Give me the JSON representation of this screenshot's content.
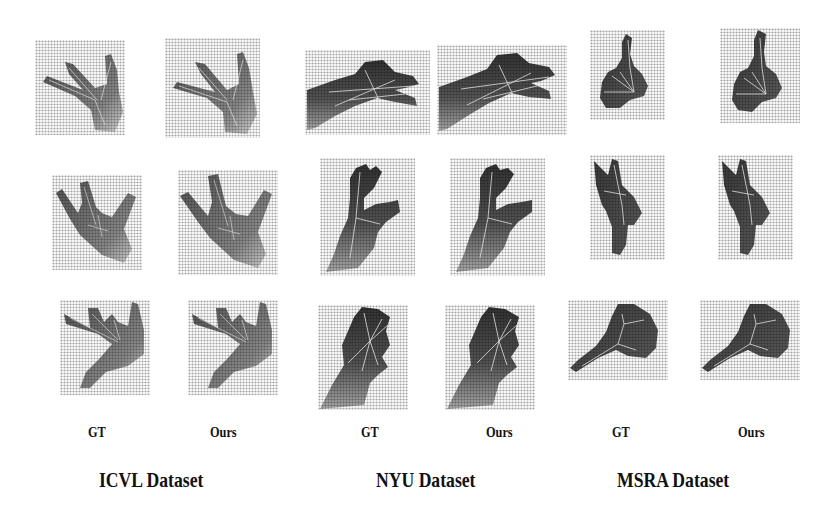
{
  "figure": {
    "column_labels": [
      "GT",
      "Ours",
      "GT",
      "Ours",
      "GT",
      "Ours"
    ],
    "datasets": [
      {
        "name": "ICVL Dataset",
        "columns": [
          "GT",
          "Ours"
        ]
      },
      {
        "name": "NYU Dataset",
        "columns": [
          "GT",
          "Ours"
        ]
      },
      {
        "name": "MSRA Dataset",
        "columns": [
          "GT",
          "Ours"
        ]
      }
    ],
    "rows": 3,
    "panels": [
      {
        "row": 1,
        "dataset": "ICVL",
        "gt": "hand-depth-gt",
        "ours": "hand-depth-pred"
      },
      {
        "row": 1,
        "dataset": "NYU",
        "gt": "hand-depth-gt",
        "ours": "hand-depth-pred"
      },
      {
        "row": 1,
        "dataset": "MSRA",
        "gt": "hand-depth-gt",
        "ours": "hand-depth-pred"
      },
      {
        "row": 2,
        "dataset": "ICVL",
        "gt": "hand-depth-gt",
        "ours": "hand-depth-pred"
      },
      {
        "row": 2,
        "dataset": "NYU",
        "gt": "hand-depth-gt",
        "ours": "hand-depth-pred"
      },
      {
        "row": 2,
        "dataset": "MSRA",
        "gt": "hand-depth-gt",
        "ours": "hand-depth-pred"
      },
      {
        "row": 3,
        "dataset": "ICVL",
        "gt": "hand-depth-gt",
        "ours": "hand-depth-pred"
      },
      {
        "row": 3,
        "dataset": "NYU",
        "gt": "hand-depth-gt",
        "ours": "hand-depth-pred"
      },
      {
        "row": 3,
        "dataset": "MSRA",
        "gt": "hand-depth-gt",
        "ours": "hand-depth-pred"
      }
    ]
  }
}
